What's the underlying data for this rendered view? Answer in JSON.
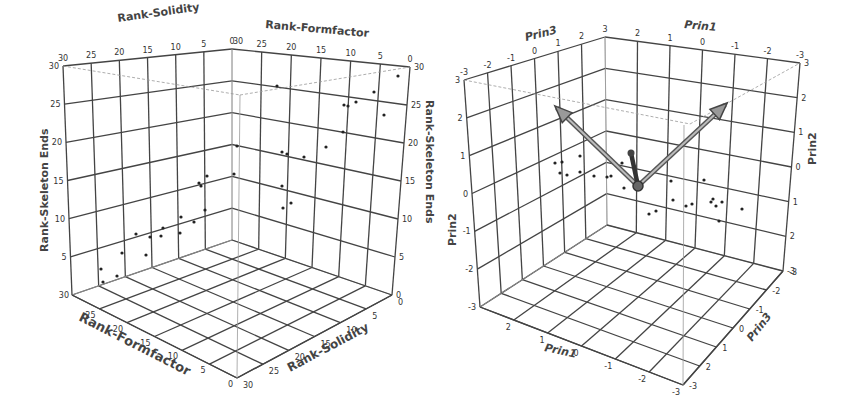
{
  "chart_data": [
    {
      "type": "scatter3d",
      "title": "",
      "axes": {
        "x": {
          "label": "Rank-Solidity",
          "ticks": [
            "30",
            "25",
            "20",
            "15",
            "10",
            "5",
            "0"
          ],
          "range": [
            0,
            30
          ]
        },
        "y": {
          "label": "Rank-Formfactor",
          "ticks": [
            "0",
            "5",
            "10",
            "15",
            "20",
            "25",
            "30"
          ],
          "range": [
            0,
            30
          ]
        },
        "z": {
          "label": "Rank-Skeleton Ends",
          "ticks": [
            "0",
            "5",
            "10",
            "15",
            "20",
            "25",
            "30"
          ],
          "range": [
            0,
            30
          ]
        }
      },
      "floor_labels": {
        "formfactor": [
          "30",
          "25",
          "20",
          "15",
          "10",
          "5",
          "0"
        ],
        "solidity": [
          "30",
          "25",
          "20",
          "15",
          "10",
          "5",
          "0"
        ]
      },
      "top_labels": {
        "solidity": [
          "30",
          "25",
          "20",
          "15",
          "10",
          "5",
          "0"
        ],
        "formfactor": [
          "30",
          "25",
          "20",
          "15",
          "10",
          "5",
          "0"
        ]
      },
      "grid": true,
      "points_screen": [
        [
          101,
          269
        ],
        [
          103,
          282
        ],
        [
          117,
          276
        ],
        [
          122,
          253
        ],
        [
          136,
          234
        ],
        [
          146,
          255
        ],
        [
          150,
          237
        ],
        [
          163,
          228
        ],
        [
          161,
          236
        ],
        [
          180,
          233
        ],
        [
          181,
          217
        ],
        [
          194,
          222
        ],
        [
          199,
          183
        ],
        [
          201,
          186
        ],
        [
          205,
          210
        ],
        [
          207,
          176
        ],
        [
          234,
          174
        ],
        [
          237,
          146
        ],
        [
          277,
          86
        ],
        [
          282,
          152
        ],
        [
          282,
          186
        ],
        [
          283,
          208
        ],
        [
          287,
          154
        ],
        [
          291,
          203
        ],
        [
          304,
          157
        ],
        [
          326,
          147
        ],
        [
          343,
          132
        ],
        [
          344,
          105
        ],
        [
          348,
          106
        ],
        [
          356,
          102
        ],
        [
          374,
          92
        ],
        [
          384,
          115
        ],
        [
          398,
          76
        ]
      ]
    },
    {
      "type": "scatter3d_biplot",
      "title": "",
      "axes": {
        "x": {
          "label": "Prin1",
          "ticks": [
            "3",
            "2",
            "1",
            "0",
            "-1",
            "-2",
            "-3"
          ],
          "range": [
            -3,
            3
          ]
        },
        "y": {
          "label": "Prin3",
          "ticks": [
            "-3",
            "-2",
            "-1",
            "0",
            "1",
            "2",
            "3"
          ],
          "range": [
            -3,
            3
          ]
        },
        "z": {
          "label": "Prin2",
          "ticks": [
            "3",
            "2",
            "1",
            "0",
            "-1",
            "-2",
            "-3"
          ],
          "range": [
            -3,
            3
          ]
        }
      },
      "floor_labels": {
        "prin1": [
          "3",
          "2",
          "1",
          "0",
          "-1",
          "-2",
          "-3"
        ],
        "prin3": [
          "3",
          "2",
          "1",
          "0",
          "-1",
          "-2",
          "-3"
        ]
      },
      "grid": true,
      "vectors": [
        {
          "name": "vector-up-left",
          "from": [
            638,
            186
          ],
          "to": [
            557,
            108
          ]
        },
        {
          "name": "vector-up-right",
          "from": [
            638,
            186
          ],
          "to": [
            725,
            105
          ]
        },
        {
          "name": "vector-short",
          "from": [
            638,
            186
          ],
          "to": [
            631,
            153
          ]
        }
      ],
      "points_screen": [
        [
          555,
          163
        ],
        [
          562,
          162
        ],
        [
          560,
          173
        ],
        [
          567,
          175
        ],
        [
          580,
          156
        ],
        [
          580,
          172
        ],
        [
          594,
          176
        ],
        [
          607,
          177
        ],
        [
          611,
          176
        ],
        [
          622,
          163
        ],
        [
          624,
          188
        ],
        [
          649,
          214
        ],
        [
          656,
          211
        ],
        [
          671,
          181
        ],
        [
          673,
          200
        ],
        [
          686,
          206
        ],
        [
          692,
          204
        ],
        [
          704,
          180
        ],
        [
          711,
          202
        ],
        [
          713,
          199
        ],
        [
          716,
          206
        ],
        [
          719,
          221
        ],
        [
          722,
          202
        ],
        [
          742,
          209
        ]
      ]
    }
  ]
}
